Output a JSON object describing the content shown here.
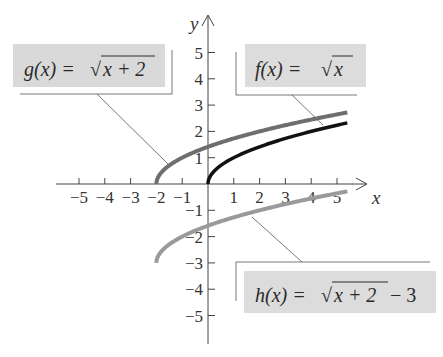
{
  "chart_data": {
    "type": "line",
    "title": "",
    "xlabel": "x",
    "ylabel": "y",
    "xlim": [
      -5.8,
      5.8
    ],
    "ylim": [
      -6,
      6
    ],
    "xticks": [
      -5,
      -4,
      -3,
      -2,
      -1,
      1,
      2,
      3,
      4,
      5
    ],
    "yticks": [
      -5,
      -4,
      -3,
      -2,
      -1,
      1,
      2,
      3,
      4,
      5
    ],
    "xtick_labels": [
      "−5",
      "−4",
      "−3",
      "−2",
      "−1",
      "1",
      "2",
      "3",
      "4",
      "5"
    ],
    "ytick_labels": [
      "−5",
      "−4",
      "−3",
      "−2",
      "−1",
      "1",
      "2",
      "3",
      "4",
      "5"
    ],
    "grid": false,
    "series": [
      {
        "name": "f(x) = √x",
        "label_func": "f(x) = ",
        "label_rad": "x",
        "label_tail": "",
        "color": "#111111",
        "domain": [
          0,
          5.4
        ],
        "x": [
          0,
          0.25,
          1,
          2,
          3,
          4,
          5,
          5.4
        ],
        "values": [
          0,
          0.5,
          1,
          1.41,
          1.73,
          2,
          2.24,
          2.32
        ]
      },
      {
        "name": "g(x) = √(x + 2)",
        "label_func": "g(x) = ",
        "label_rad": "x + 2",
        "label_tail": "",
        "color": "#6e6e6e",
        "domain": [
          -2,
          5.4
        ],
        "x": [
          -2,
          -1.75,
          -1,
          0,
          1,
          2,
          3,
          4,
          5,
          5.4
        ],
        "values": [
          0,
          0.5,
          1,
          1.41,
          1.73,
          2,
          2.24,
          2.45,
          2.65,
          2.72
        ]
      },
      {
        "name": "h(x) = √(x + 2) − 3",
        "label_func": "h(x) = ",
        "label_rad": "x + 2",
        "label_tail": " − 3",
        "color": "#9a9a9a",
        "domain": [
          -2,
          5.4
        ],
        "x": [
          -2,
          -1.75,
          -1,
          0,
          1,
          2,
          3,
          4,
          5,
          5.4
        ],
        "values": [
          -3,
          -2.5,
          -2,
          -1.59,
          -1.27,
          -1,
          -0.76,
          -0.55,
          -0.35,
          -0.28
        ]
      }
    ],
    "annotations": [
      {
        "text": "g(x) = √(x + 2)",
        "position": "upper-left"
      },
      {
        "text": "f(x) = √x",
        "position": "upper-right"
      },
      {
        "text": "h(x) = √(x + 2) − 3",
        "position": "lower-right"
      }
    ]
  },
  "labels": {
    "x_axis": "x",
    "y_axis": "y",
    "g_func": "g(x) = ",
    "g_rad": "x + 2",
    "f_func": "f(x) = ",
    "f_rad": "x",
    "h_func": "h(x) = ",
    "h_rad": "x + 2",
    "h_tail": "− 3"
  }
}
